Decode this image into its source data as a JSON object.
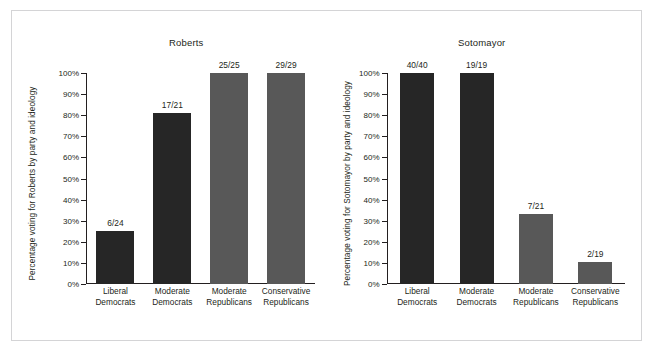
{
  "figure": {
    "frame_border_color": "#d4d4d6",
    "background": "#ffffff",
    "text_color": "#231f20"
  },
  "colors": {
    "democrat_bar": "#262626",
    "republican_bar": "#585858",
    "axis": "#231f20"
  },
  "y_axis": {
    "ticks": [
      "0%",
      "10%",
      "20%",
      "30%",
      "40%",
      "50%",
      "60%",
      "70%",
      "80%",
      "90%",
      "100%"
    ],
    "min": 0,
    "max": 100
  },
  "categories": [
    {
      "line1": "Liberal",
      "line2": "Democrats"
    },
    {
      "line1": "Moderate",
      "line2": "Democrats"
    },
    {
      "line1": "Moderate",
      "line2": "Republicans"
    },
    {
      "line1": "Conservative",
      "line2": "Republicans"
    }
  ],
  "panels": [
    {
      "id": "roberts",
      "title": "Roberts",
      "y_axis_title": "Percentage voting for Roberts by party and ideology",
      "bars": [
        {
          "label": "6/24",
          "value": 25.0,
          "color": "#262626"
        },
        {
          "label": "17/21",
          "value": 81.0,
          "color": "#262626"
        },
        {
          "label": "25/25",
          "value": 100.0,
          "color": "#585858"
        },
        {
          "label": "29/29",
          "value": 100.0,
          "color": "#585858"
        }
      ]
    },
    {
      "id": "sotomayor",
      "title": "Sotomayor",
      "y_axis_title": "Percentage voting for Sotomayor by party and ideology",
      "bars": [
        {
          "label": "40/40",
          "value": 100.0,
          "color": "#262626"
        },
        {
          "label": "19/19",
          "value": 100.0,
          "color": "#262626"
        },
        {
          "label": "7/21",
          "value": 33.3,
          "color": "#585858"
        },
        {
          "label": "2/19",
          "value": 10.5,
          "color": "#585858"
        }
      ]
    }
  ],
  "chart_data": {
    "type": "bar",
    "xlabel": "",
    "ylabel": "Percentage voting by party and ideology",
    "ylim": [
      0,
      100
    ],
    "ytick_labels": [
      "0%",
      "10%",
      "20%",
      "30%",
      "40%",
      "50%",
      "60%",
      "70%",
      "80%",
      "90%",
      "100%"
    ],
    "grid": false,
    "legend": "none",
    "panel_layout": "1x2",
    "categories": [
      "Liberal Democrats",
      "Moderate Democrats",
      "Moderate Republicans",
      "Conservative Republicans"
    ],
    "panels": [
      {
        "title": "Roberts",
        "ylabel": "Percentage voting for Roberts by party and ideology",
        "values": [
          25.0,
          81.0,
          100.0,
          100.0
        ],
        "annotations": [
          "6/24",
          "17/21",
          "25/25",
          "29/29"
        ],
        "bar_colors": [
          "#262626",
          "#262626",
          "#585858",
          "#585858"
        ]
      },
      {
        "title": "Sotomayor",
        "ylabel": "Percentage voting for Sotomayor by party and ideology",
        "values": [
          100.0,
          100.0,
          33.3,
          10.5
        ],
        "annotations": [
          "40/40",
          "19/19",
          "7/21",
          "2/19"
        ],
        "bar_colors": [
          "#262626",
          "#262626",
          "#585858",
          "#585858"
        ]
      }
    ]
  }
}
